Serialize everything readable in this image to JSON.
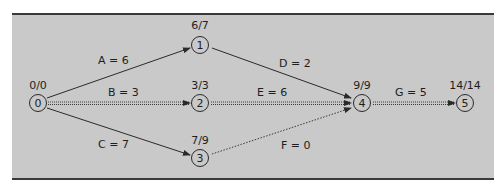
{
  "diagram": {
    "type": "activity-on-arrow network",
    "colors": {
      "panel_bg": "#c9c9c9",
      "line": "#2a2a2a",
      "border": "#3a3a3a"
    },
    "nodes": [
      {
        "id": "0",
        "label": "0",
        "times": "0/0"
      },
      {
        "id": "1",
        "label": "1",
        "times": "6/7"
      },
      {
        "id": "2",
        "label": "2",
        "times": "3/3"
      },
      {
        "id": "3",
        "label": "3",
        "times": "7/9"
      },
      {
        "id": "4",
        "label": "4",
        "times": "9/9"
      },
      {
        "id": "5",
        "label": "5",
        "times": "14/14"
      }
    ],
    "edges": [
      {
        "from": "0",
        "to": "1",
        "label": "A = 6",
        "style": "solid"
      },
      {
        "from": "0",
        "to": "2",
        "label": "B = 3",
        "style": "critical"
      },
      {
        "from": "0",
        "to": "3",
        "label": "C = 7",
        "style": "solid"
      },
      {
        "from": "1",
        "to": "4",
        "label": "D = 2",
        "style": "solid"
      },
      {
        "from": "2",
        "to": "4",
        "label": "E = 6",
        "style": "critical"
      },
      {
        "from": "3",
        "to": "4",
        "label": "F = 0",
        "style": "dummy"
      },
      {
        "from": "4",
        "to": "5",
        "label": "G = 5",
        "style": "critical"
      }
    ]
  }
}
